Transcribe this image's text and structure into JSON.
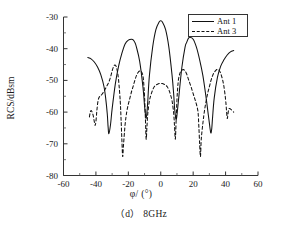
{
  "figure": {
    "xlabel": "φ/ (°)",
    "ylabel": "RCS/dBsm",
    "subcaption": "（d） 8GHz",
    "line_color": "#111111"
  },
  "chart_data": {
    "type": "line",
    "title": "",
    "subtitle": "（d） 8GHz",
    "xlabel": "φ/ (°)",
    "ylabel": "RCS/dBsm",
    "xlim": [
      -60,
      60
    ],
    "ylim": [
      -80,
      -30
    ],
    "xticks": [
      -60,
      -40,
      -20,
      0,
      20,
      40,
      60
    ],
    "yticks": [
      -30,
      -40,
      -50,
      -60,
      -70,
      -80
    ],
    "grid": false,
    "legend_position": "top-right",
    "series": [
      {
        "name": "Ant 1",
        "style": "solid",
        "color": "#111111",
        "x": [
          -45,
          -43,
          -41,
          -39,
          -37,
          -35,
          -34,
          -33,
          -32.5,
          -32,
          -31,
          -30,
          -28,
          -26,
          -24,
          -22,
          -20,
          -18,
          -17,
          -16,
          -15,
          -13,
          -11,
          -10,
          -9.5,
          -9,
          -8.5,
          -8,
          -7,
          -5,
          -3,
          -1,
          0,
          1,
          3,
          5,
          7,
          8,
          8.5,
          9,
          9.5,
          10,
          11,
          13,
          15,
          16,
          17,
          18,
          20,
          22,
          24,
          26,
          28,
          29,
          30,
          30.5,
          31,
          31.5,
          32,
          33,
          35,
          37,
          39,
          41,
          43,
          45
        ],
        "y": [
          -42.8,
          -43.2,
          -44.2,
          -45.8,
          -48.2,
          -52.0,
          -55.5,
          -60.5,
          -64.5,
          -66.8,
          -64.0,
          -59.0,
          -51.0,
          -45.5,
          -41.5,
          -38.5,
          -37.3,
          -37.0,
          -37.2,
          -38.0,
          -39.5,
          -44.0,
          -52.0,
          -58.0,
          -60.5,
          -62.0,
          -60.0,
          -56.5,
          -48.5,
          -39.5,
          -34.0,
          -31.6,
          -31.2,
          -31.6,
          -34.0,
          -39.5,
          -48.5,
          -54.5,
          -58.5,
          -61.0,
          -62.5,
          -61.0,
          -56.0,
          -46.0,
          -39.5,
          -38.0,
          -36.8,
          -36.4,
          -37.0,
          -39.5,
          -43.5,
          -48.5,
          -55.5,
          -59.5,
          -63.5,
          -65.5,
          -66.6,
          -65.0,
          -61.5,
          -55.5,
          -49.0,
          -45.5,
          -43.5,
          -42.0,
          -41.0,
          -40.6
        ]
      },
      {
        "name": "Ant 3",
        "style": "dashed",
        "color": "#111111",
        "x": [
          -44,
          -43.5,
          -43,
          -42.5,
          -42,
          -41.5,
          -41,
          -40.5,
          -40,
          -39.5,
          -39,
          -38.5,
          -38,
          -37.5,
          -37,
          -36,
          -35,
          -34,
          -33,
          -32,
          -31,
          -30,
          -29,
          -28,
          -27,
          -26,
          -25,
          -24.5,
          -24,
          -23.5,
          -23,
          -22,
          -21,
          -20,
          -19,
          -18,
          -17,
          -16,
          -15,
          -14,
          -13,
          -12,
          -11,
          -10.5,
          -10,
          -9.5,
          -9,
          -8.5,
          -8,
          -7,
          -6,
          -5,
          -4,
          -3,
          -2,
          -1,
          0,
          1,
          2,
          3,
          4,
          5,
          6,
          7,
          8,
          8.5,
          9,
          9.5,
          10,
          10.5,
          11,
          12,
          13,
          14,
          15,
          16,
          17,
          18,
          19,
          20,
          21,
          22,
          23,
          23.5,
          24,
          24.5,
          25,
          26,
          27,
          28,
          29,
          30,
          31,
          32,
          33,
          34,
          35,
          36,
          37,
          38,
          39,
          40,
          40.5,
          41,
          41.5,
          42,
          43,
          44,
          45
        ],
        "y": [
          -61.5,
          -60.0,
          -59.5,
          -59.8,
          -60.5,
          -61.5,
          -63.0,
          -64.2,
          -63.0,
          -60.0,
          -57.5,
          -56.0,
          -55.3,
          -55.0,
          -54.8,
          -54.2,
          -53.5,
          -52.5,
          -51.5,
          -50.5,
          -49.0,
          -47.0,
          -45.5,
          -45.2,
          -46.5,
          -50.0,
          -56.5,
          -62.0,
          -68.5,
          -74.0,
          -70.5,
          -64.0,
          -60.0,
          -57.5,
          -55.5,
          -53.5,
          -51.8,
          -50.0,
          -48.5,
          -47.5,
          -47.0,
          -47.2,
          -48.5,
          -51.0,
          -55.0,
          -61.5,
          -68.5,
          -64.5,
          -60.5,
          -56.5,
          -54.5,
          -53.0,
          -52.0,
          -51.5,
          -51.2,
          -51.0,
          -51.0,
          -51.0,
          -51.2,
          -51.5,
          -52.0,
          -53.0,
          -54.5,
          -56.5,
          -60.5,
          -64.5,
          -68.5,
          -62.5,
          -56.0,
          -52.0,
          -49.5,
          -47.5,
          -46.8,
          -46.6,
          -47.0,
          -48.0,
          -49.5,
          -51.0,
          -52.5,
          -54.2,
          -55.8,
          -57.5,
          -60.0,
          -64.5,
          -70.0,
          -74.0,
          -68.5,
          -63.5,
          -59.5,
          -56.5,
          -54.0,
          -52.0,
          -50.0,
          -48.5,
          -47.5,
          -46.8,
          -46.5,
          -46.8,
          -47.8,
          -49.5,
          -52.0,
          -56.0,
          -59.0,
          -62.0,
          -60.5,
          -59.0,
          -59.0,
          -59.5,
          -60.0
        ]
      }
    ]
  },
  "axis": {
    "xtick_labels": [
      "-60",
      "-40",
      "-20",
      "0",
      "20",
      "40",
      "60"
    ],
    "ytick_labels": [
      "-30",
      "-40",
      "-50",
      "-60",
      "-70",
      "-80"
    ]
  },
  "legend": {
    "entries": [
      {
        "label": "Ant 1",
        "style": "solid"
      },
      {
        "label": "Ant 3",
        "style": "dashed"
      }
    ]
  }
}
